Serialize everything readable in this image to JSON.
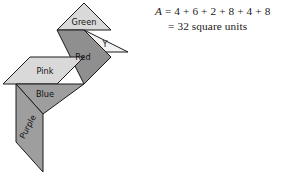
{
  "figure": {
    "background_color": "#ffffff",
    "outline_color": "#1a1a1a"
  },
  "pieces": [
    {
      "id": "green",
      "label": "Green",
      "shape": "triangle",
      "fill": "#d9d9d9",
      "points": "84,3 111,30 57,30",
      "label_x": 84,
      "label_y": 22,
      "rotation": 0
    },
    {
      "id": "y",
      "label": "Y",
      "shape": "triangle",
      "fill": "#f2f2f2",
      "points": "84,30 128,52 84,52",
      "label_x": 105,
      "label_y": 44,
      "rotation": 0
    },
    {
      "id": "red",
      "label": "Red",
      "shape": "quadrilateral",
      "fill": "#8f8f8f",
      "points": "57,30 84,30 111,57 84,84",
      "label_x": 83,
      "label_y": 57,
      "rotation": 0
    },
    {
      "id": "pink",
      "label": "Pink",
      "shape": "parallelogram",
      "fill": "#d9d9d9",
      "points": "30,57 84,57 57,84 3,84",
      "label_x": 45,
      "label_y": 71,
      "rotation": 0
    },
    {
      "id": "blue",
      "label": "Blue",
      "shape": "triangle",
      "fill": "#9e9e9e",
      "points": "16,84 84,84 43,114",
      "label_x": 45,
      "label_y": 94,
      "rotation": 0
    },
    {
      "id": "purple",
      "label": "Purple",
      "shape": "parallelogram",
      "fill": "#9e9e9e",
      "points": "16,84 43,114 43,172 16,142",
      "label_x": 28,
      "label_y": 127,
      "rotation": -62
    }
  ],
  "equation": {
    "variable": "A",
    "line_1": "A = 4 + 6 + 2 + 8 + 4 + 8",
    "line_2": "= 32 square units",
    "terms": [
      4,
      6,
      2,
      8,
      4,
      8
    ],
    "total": 32,
    "unit": "square units"
  }
}
